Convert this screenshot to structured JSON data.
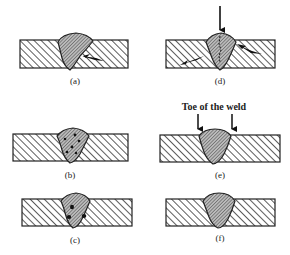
{
  "figure": {
    "panels": [
      {
        "id": "a",
        "label": "(a)",
        "feature": "crack-in-base-metal",
        "has_arrow_indicator": true
      },
      {
        "id": "b",
        "label": "(b)",
        "feature": "porosity"
      },
      {
        "id": "c",
        "label": "(c)",
        "feature": "slag-inclusions"
      },
      {
        "id": "d",
        "label": "(d)",
        "feature": "centerline-and-heat-affected-cracks",
        "has_top_arrow": true
      },
      {
        "id": "e",
        "label": "(e)",
        "feature": "toe-of-weld",
        "annotation": "Toe of the weld"
      },
      {
        "id": "f",
        "label": "(f)",
        "feature": "sound-weld"
      }
    ]
  },
  "colors": {
    "line": "#222222",
    "hatch": "#333333",
    "background": "#ffffff"
  }
}
